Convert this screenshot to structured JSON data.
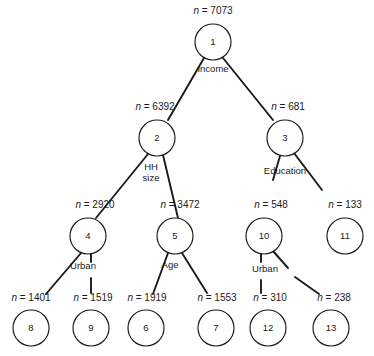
{
  "figure": {
    "name": "classification-tree-diagram",
    "background_color": "#ffffff",
    "stroke_color": "#1a1a1a",
    "width": 374,
    "height": 356
  },
  "count_prefix": "n",
  "count_separator": "=",
  "nodes": [
    {
      "id": "1",
      "label": "1",
      "count": "7073",
      "count_text": "n = 7073",
      "cx": 213,
      "cy": 42,
      "r": 18
    },
    {
      "id": "2",
      "label": "2",
      "count": "6392",
      "count_text": "n = 6392",
      "cx": 157,
      "cy": 138,
      "r": 18
    },
    {
      "id": "3",
      "label": "3",
      "count": "681",
      "count_text": "n = 681",
      "cx": 285,
      "cy": 138,
      "r": 18
    },
    {
      "id": "4",
      "label": "4",
      "count": "2920",
      "count_text": "n = 2920",
      "cx": 88,
      "cy": 236,
      "r": 18
    },
    {
      "id": "5",
      "label": "5",
      "count": "3472",
      "count_text": "n = 3472",
      "cx": 175,
      "cy": 236,
      "r": 18
    },
    {
      "id": "10",
      "label": "10",
      "count": "548",
      "count_text": "n = 548",
      "cx": 264,
      "cy": 236,
      "r": 18
    },
    {
      "id": "11",
      "label": "11",
      "count": "133",
      "count_text": "n = 133",
      "cx": 345,
      "cy": 236,
      "r": 18
    },
    {
      "id": "8",
      "label": "8",
      "count": "1401",
      "count_text": "n = 1401",
      "cx": 31,
      "cy": 328,
      "r": 18
    },
    {
      "id": "9",
      "label": "9",
      "count": "1519",
      "count_text": "n = 1519",
      "cx": 91,
      "cy": 328,
      "r": 18
    },
    {
      "id": "6",
      "label": "6",
      "count": "1919",
      "count_text": "n = 1919",
      "cx": 146,
      "cy": 328,
      "r": 18
    },
    {
      "id": "7",
      "label": "7",
      "count": "1553",
      "count_text": "n = 1553",
      "cx": 216,
      "cy": 328,
      "r": 18
    },
    {
      "id": "12",
      "label": "12",
      "count": "310",
      "count_text": "n = 310",
      "cx": 268,
      "cy": 328,
      "r": 18
    },
    {
      "id": "13",
      "label": "13",
      "count": "238",
      "count_text": "n = 238",
      "cx": 331,
      "cy": 328,
      "r": 18
    }
  ],
  "count_labels": [
    {
      "for_node": "1",
      "text": "n = 7073",
      "x": 213,
      "y": 14
    },
    {
      "for_node": "2",
      "text": "n = 6392",
      "x": 155,
      "y": 110
    },
    {
      "for_node": "3",
      "text": "n = 681",
      "x": 288,
      "y": 110
    },
    {
      "for_node": "4",
      "text": "n = 2920",
      "x": 95,
      "y": 208
    },
    {
      "for_node": "5",
      "text": "n = 3472",
      "x": 180,
      "y": 208
    },
    {
      "for_node": "10",
      "text": "n = 548",
      "x": 271,
      "y": 208
    },
    {
      "for_node": "11",
      "text": "n = 133",
      "x": 345,
      "y": 208
    },
    {
      "for_node": "8",
      "text": "n = 1401",
      "x": 31,
      "y": 301
    },
    {
      "for_node": "9",
      "text": "n = 1519",
      "x": 93,
      "y": 301
    },
    {
      "for_node": "6",
      "text": "n = 1919",
      "x": 147,
      "y": 301
    },
    {
      "for_node": "7",
      "text": "n = 1553",
      "x": 217,
      "y": 301
    },
    {
      "for_node": "12",
      "text": "n = 310",
      "x": 270,
      "y": 301
    },
    {
      "for_node": "13",
      "text": "n = 238",
      "x": 334,
      "y": 301
    }
  ],
  "split_labels": [
    {
      "parent": "1",
      "text": "Income",
      "lines": [
        "Income"
      ],
      "x": 213,
      "y": 72
    },
    {
      "parent": "2",
      "text": "HH size",
      "lines": [
        "HH",
        "size"
      ],
      "x": 151,
      "y": 170
    },
    {
      "parent": "3",
      "text": "Education",
      "lines": [
        "Education"
      ],
      "x": 285,
      "y": 174
    },
    {
      "parent": "4",
      "text": "Urban",
      "lines": [
        "Urban"
      ],
      "x": 83,
      "y": 269
    },
    {
      "parent": "5",
      "text": "Age",
      "lines": [
        "Age"
      ],
      "x": 170,
      "y": 268
    },
    {
      "parent": "10",
      "text": "Urban",
      "lines": [
        "Urban"
      ],
      "x": 265,
      "y": 272
    }
  ],
  "edges": [
    {
      "from": "1",
      "to": "2",
      "x1": 204,
      "y1": 58,
      "x2": 168,
      "y2": 120
    },
    {
      "from": "1",
      "to": "3",
      "x1": 223,
      "y1": 58,
      "x2": 273,
      "y2": 120
    },
    {
      "from": "2",
      "to": "4",
      "x1": 148,
      "y1": 154,
      "x2": 96,
      "y2": 218
    },
    {
      "from": "2",
      "to": "5",
      "x1": 163,
      "y1": 155,
      "x2": 178,
      "y2": 218
    },
    {
      "from": "3",
      "to": "10",
      "x1": 280,
      "y1": 156,
      "x2": 273,
      "y2": 180
    },
    {
      "from": "3",
      "to": "11",
      "x1": 294,
      "y1": 153,
      "x2": 322,
      "y2": 190
    },
    {
      "from": "4",
      "to": "8",
      "x1": 81,
      "y1": 253,
      "x2": 46,
      "y2": 294
    },
    {
      "from": "4",
      "to": "9",
      "x1": 91,
      "y1": 253,
      "x2": 91,
      "y2": 262
    },
    {
      "from": "4",
      "to": "9b",
      "x1": 91,
      "y1": 278,
      "x2": 91,
      "y2": 293
    },
    {
      "from": "5",
      "to": "6",
      "x1": 168,
      "y1": 253,
      "x2": 153,
      "y2": 294
    },
    {
      "from": "5",
      "to": "7",
      "x1": 182,
      "y1": 253,
      "x2": 207,
      "y2": 293
    },
    {
      "from": "10",
      "to": "12",
      "x1": 261,
      "y1": 253,
      "x2": 261,
      "y2": 262
    },
    {
      "from": "10",
      "to": "12b",
      "x1": 261,
      "y1": 280,
      "x2": 261,
      "y2": 293
    },
    {
      "from": "10",
      "to": "13",
      "x1": 273,
      "y1": 251,
      "x2": 288,
      "y2": 268
    },
    {
      "from": "10",
      "to": "13b",
      "x1": 295,
      "y1": 277,
      "x2": 319,
      "y2": 294
    }
  ]
}
